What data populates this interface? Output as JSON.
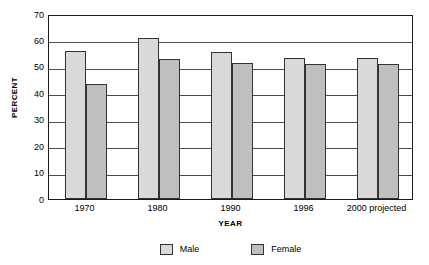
{
  "chart_data": {
    "type": "bar",
    "title": "",
    "subtitle": "",
    "xlabel": "YEAR",
    "ylabel": "PERCENT",
    "categories": [
      "1970",
      "1980",
      "1990",
      "1996",
      "2000 projected"
    ],
    "series": [
      {
        "name": "Male",
        "values": [
          56,
          61,
          55.5,
          53.5,
          53.5
        ],
        "color": "#d9d9d9"
      },
      {
        "name": "Female",
        "values": [
          43.5,
          53,
          51.5,
          51,
          51
        ],
        "color": "#bfbfbf"
      }
    ],
    "ylim": [
      0,
      70
    ],
    "yticks": [
      0,
      10,
      20,
      30,
      40,
      50,
      60,
      70
    ],
    "ytick_labels": [
      "0",
      "10",
      "20",
      "30",
      "40",
      "50",
      "60",
      "70"
    ],
    "grid": "horizontal",
    "legend_position": "bottom",
    "legend_entries": [
      "Male",
      "Female"
    ],
    "bar_border_color": "#333333",
    "axis_color": "#1a1a1a",
    "gridline_color": "#4d4d4d",
    "background": "#ffffff"
  }
}
